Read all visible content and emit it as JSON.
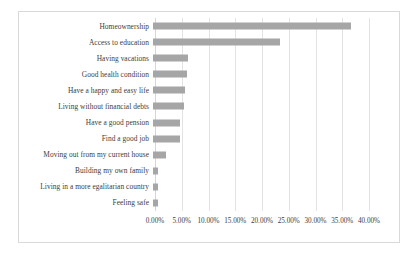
{
  "chart_data": {
    "type": "bar",
    "orientation": "horizontal",
    "title": "",
    "subtitle": "",
    "xlabel": "",
    "ylabel": "",
    "xlim": [
      0,
      40
    ],
    "xtick_format": "percent",
    "grid": true,
    "legend": false,
    "bar_color": "#a6a6a6",
    "gridline_color": "#e3e3e3",
    "text_color": "#404040",
    "categories": [
      "Homeownership",
      "Access to education",
      "Having vacations",
      "Good health condition",
      "Have a happy and easy life",
      "Living without financial debts",
      "Have a good pension",
      "Find a good job",
      "Moving out from my current house",
      "Building my own family",
      "Living in a more egalitarian country",
      "Feeling safe"
    ],
    "values": [
      37.0,
      23.7,
      6.5,
      6.4,
      5.9,
      5.8,
      5.1,
      5.0,
      2.4,
      1.0,
      1.0,
      1.0
    ],
    "tick_values": [
      0,
      5,
      10,
      15,
      20,
      25,
      30,
      35,
      40
    ],
    "tick_labels": [
      "0.00%",
      "5.00%",
      "10.00%",
      "15.00%",
      "20.00%",
      "25.00%",
      "30.00%",
      "35.00%",
      "40.00%"
    ]
  }
}
